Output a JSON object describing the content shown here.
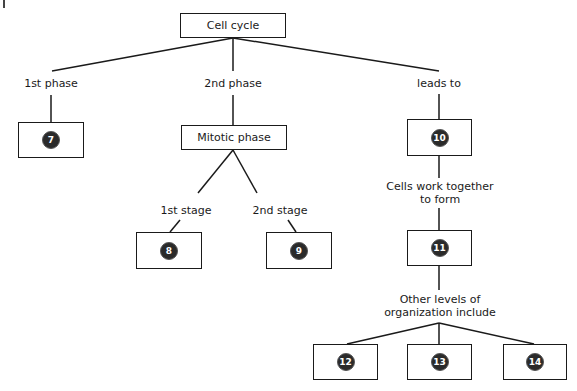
{
  "diagram": {
    "root": {
      "label": "Cell cycle"
    },
    "edges_labels": {
      "first_phase": "1st phase",
      "second_phase": "2nd phase",
      "leads_to": "leads to",
      "first_stage": "1st stage",
      "second_stage": "2nd stage",
      "cells_work_together": "Cells work together",
      "to_form": "to form",
      "other_levels": "Other levels of",
      "organization_include": "organization include"
    },
    "mitotic_phase": {
      "label": "Mitotic phase"
    },
    "blanks": {
      "b7": "7",
      "b8": "8",
      "b9": "9",
      "b10": "10",
      "b11": "11",
      "b12": "12",
      "b13": "13",
      "b14": "14"
    }
  }
}
